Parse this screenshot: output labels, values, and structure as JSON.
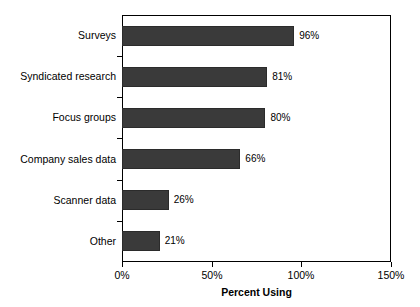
{
  "chart_data": {
    "type": "bar",
    "orientation": "horizontal",
    "title": "",
    "xlabel": "Percent Using",
    "ylabel": "",
    "categories": [
      "Surveys",
      "Syndicated research",
      "Focus groups",
      "Company sales data",
      "Scanner data",
      "Other"
    ],
    "values": [
      96,
      81,
      80,
      66,
      26,
      21
    ],
    "value_labels": [
      "96%",
      "81%",
      "80%",
      "66%",
      "26%",
      "21%"
    ],
    "xlim": [
      0,
      150
    ],
    "xticks": [
      0,
      50,
      100,
      150
    ],
    "xtick_labels": [
      "0%",
      "50%",
      "100%",
      "150%"
    ],
    "grid": false,
    "legend": false,
    "bar_color": "#3a3a3a",
    "bar_edge_color": "#2b2b2b",
    "frame_color": "#000000",
    "background_color": "#ffffff",
    "text_color": "#000000"
  }
}
